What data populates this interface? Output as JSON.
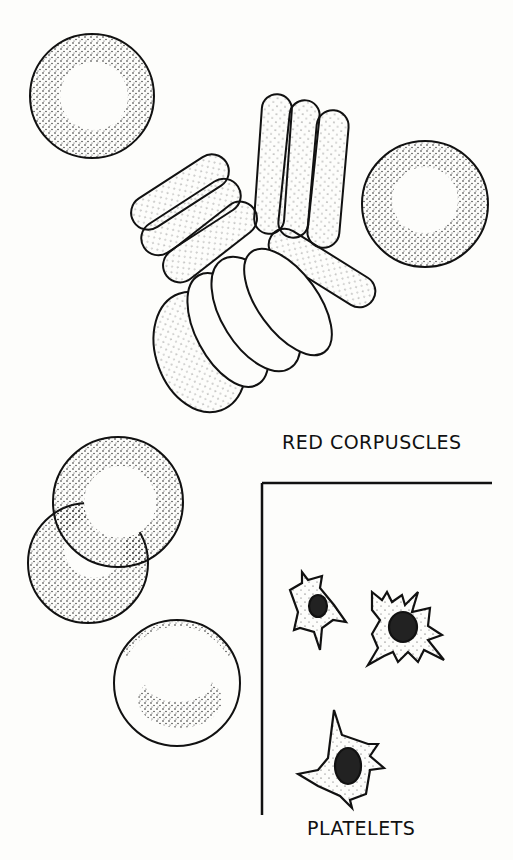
{
  "figure": {
    "labels": {
      "red_corpuscles": "RED CORPUSCLES",
      "platelets": "PLATELETS"
    },
    "panels": [
      {
        "name": "red-corpuscles",
        "label": "RED CORPUSCLES",
        "items": "biconcave discs, face-on and rouleaux stacks"
      },
      {
        "name": "platelets",
        "label": "PLATELETS",
        "count": 3
      }
    ],
    "colors": {
      "ink": "#111111",
      "paper": "#fdfdfb"
    }
  }
}
